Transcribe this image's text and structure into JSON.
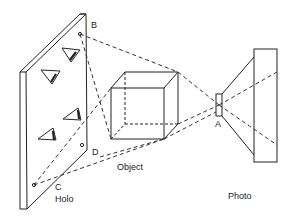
{
  "figure": {
    "labels": {
      "point_b": "B",
      "point_c": "C",
      "point_d": "D",
      "point_a": "A",
      "holo": "Holo",
      "object": "Object",
      "photo": "Photo"
    },
    "elements": {
      "holo_plate": "hologram plate with viewing eyes",
      "object": "wireframe cube",
      "photo_camera": "camera lens and film plate"
    },
    "colors": {
      "stroke": "#222222",
      "background": "#ffffff"
    }
  }
}
